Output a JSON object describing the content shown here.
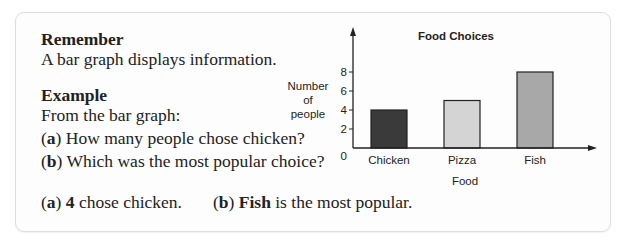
{
  "remember": {
    "heading": "Remember",
    "text": "A bar graph displays information."
  },
  "example": {
    "heading": "Example",
    "intro": "From the bar graph:",
    "questions": [
      {
        "label": "a",
        "text": "How many people chose chicken?"
      },
      {
        "label": "b",
        "text": "Which was the most popular choice?"
      }
    ],
    "answers": [
      {
        "label": "a",
        "bold": "4",
        "text": " chose chicken."
      },
      {
        "label": "b",
        "bold": "Fish",
        "text": " is the most popular."
      }
    ]
  },
  "chart_data": {
    "type": "bar",
    "title": "Food Choices",
    "xlabel": "Food",
    "ylabel": "Number of people",
    "ylabel_lines": [
      "Number",
      "of",
      "people"
    ],
    "categories": [
      "Chicken",
      "Pizza",
      "Fish"
    ],
    "values": [
      4,
      5,
      8
    ],
    "bar_colors": [
      "#3a3a3a",
      "#d4d4d4",
      "#a8a8a8"
    ],
    "yticks": [
      2,
      4,
      6,
      8
    ],
    "origin_label": "0",
    "ylim": [
      0,
      10
    ],
    "grid": false,
    "legend": false
  }
}
